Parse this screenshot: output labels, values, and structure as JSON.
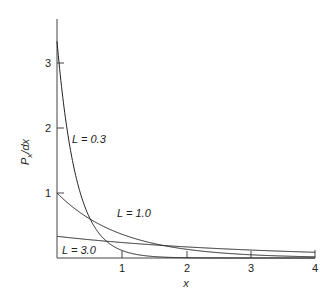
{
  "chart_data": {
    "type": "line",
    "title": "",
    "xlabel": "x",
    "ylabel": "P_x/dx",
    "xlim": [
      0,
      4
    ],
    "ylim": [
      0,
      3.68
    ],
    "xticks": [
      1,
      2,
      3,
      4
    ],
    "yticks": [
      1,
      2,
      3
    ],
    "grid": false,
    "legend": "inline labels",
    "function": "(1/L) * exp(-x/L)",
    "series": [
      {
        "name": "L = 0.3",
        "L": 0.3,
        "x": [
          0,
          0.25,
          0.5,
          0.75,
          1.0,
          1.5,
          2.0
        ],
        "values": [
          3.33,
          1.45,
          0.63,
          0.27,
          0.12,
          0.02,
          0.004
        ]
      },
      {
        "name": "L = 1.0",
        "L": 1.0,
        "x": [
          0,
          0.5,
          1,
          2,
          3,
          4
        ],
        "values": [
          1.0,
          0.61,
          0.37,
          0.14,
          0.05,
          0.02
        ]
      },
      {
        "name": "L = 3.0",
        "L": 3.0,
        "x": [
          0,
          1,
          2,
          3,
          4
        ],
        "values": [
          0.33,
          0.24,
          0.17,
          0.12,
          0.09
        ]
      }
    ],
    "annotations": [
      {
        "text": "L = 0.3",
        "x": 0.25,
        "y": 1.8
      },
      {
        "text": "L = 1.0",
        "x": 0.95,
        "y": 0.68
      },
      {
        "text": "L = 3.0",
        "x": 0.1,
        "y": 0.12
      }
    ]
  },
  "axes": {
    "x_label": "x",
    "y_label_main": "P",
    "y_label_sub": "x",
    "y_label_tail": "/dx",
    "x_ticks": [
      "1",
      "2",
      "3",
      "4"
    ],
    "y_ticks": [
      "1",
      "2",
      "3"
    ]
  },
  "labels": {
    "l03": "L = 0.3",
    "l10": "L = 1.0",
    "l30": "L = 3.0"
  },
  "colors": {
    "line": "#222222",
    "axis": "#444444"
  }
}
